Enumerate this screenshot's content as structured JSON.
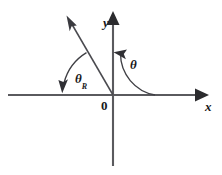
{
  "figure": {
    "name": "reference-angle-diagram",
    "background_color": "#ffffff",
    "stroke_color": "#3f3f44",
    "text_color": "#18181a",
    "width": 222,
    "height": 175
  },
  "axes": {
    "origin": {
      "x": 113,
      "y": 95
    },
    "x_axis": {
      "label": "x",
      "start": {
        "x": 8,
        "y": 95
      },
      "end": {
        "x": 200,
        "y": 95
      },
      "arrow_at": "positive-end"
    },
    "y_axis": {
      "label": "y",
      "start": {
        "x": 113,
        "y": 165
      },
      "end": {
        "x": 113,
        "y": 18
      },
      "arrow_at": "positive-end"
    },
    "origin_label": "0"
  },
  "ray": {
    "name": "terminal-ray",
    "from": {
      "x": 113,
      "y": 95
    },
    "to": {
      "x": 68,
      "y": 18
    },
    "arrow_at": "tip",
    "quadrant": 2
  },
  "angles": [
    {
      "id": "theta",
      "label": "θ",
      "subscript": "",
      "meaning": "standard-position-angle",
      "measured_from": "positive-x-axis",
      "measured_to": "terminal-ray",
      "direction": "counterclockwise",
      "arc_radius": 42,
      "label_position": {
        "x": 130,
        "y": 58
      }
    },
    {
      "id": "theta-r",
      "label": "θ",
      "subscript": "R",
      "meaning": "reference-angle",
      "measured_from": "terminal-ray",
      "measured_to": "negative-x-axis",
      "direction": "counterclockwise",
      "arc_radius": 50,
      "label_position": {
        "x": 75,
        "y": 72
      }
    }
  ]
}
